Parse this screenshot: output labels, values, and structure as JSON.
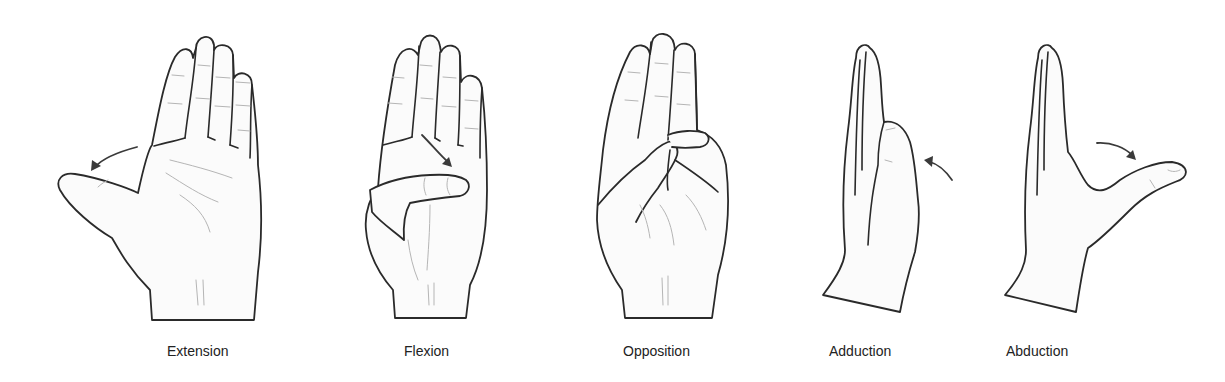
{
  "figure": {
    "panels": [
      {
        "id": "extension",
        "label": "Extension",
        "icon": "hand-thumb-extension-icon",
        "arrow": "arrow-left-outward"
      },
      {
        "id": "flexion",
        "label": "Flexion",
        "icon": "hand-thumb-flexion-icon",
        "arrow": "arrow-down-across-palm"
      },
      {
        "id": "opposition",
        "label": "Opposition",
        "icon": "hand-thumb-opposition-icon",
        "arrow": "none"
      },
      {
        "id": "adduction",
        "label": "Adduction",
        "icon": "hand-thumb-adduction-icon",
        "arrow": "arrow-toward-palm"
      },
      {
        "id": "abduction",
        "label": "Abduction",
        "icon": "hand-thumb-abduction-icon",
        "arrow": "arrow-away-from-palm"
      }
    ],
    "colors": {
      "background": "#ffffff",
      "outline": "#2a2a2a",
      "crease": "#b5b5b5",
      "label": "#222222"
    }
  }
}
